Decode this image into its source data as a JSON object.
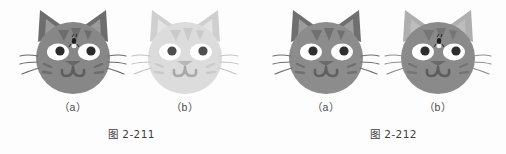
{
  "page": {
    "background_color": "#fdfdfd",
    "width": 506,
    "height": 154
  },
  "figures": [
    {
      "caption": "图 2-211",
      "items": [
        {
          "sublabel": "（a）",
          "icon": "cat-face-icon",
          "description": "dark gray tabby cat face with flea mark on forehead",
          "colors": {
            "face": "#878787",
            "ear_outer": "#6d6d6d",
            "ear_inner": "#9a9a9a",
            "stripe": "#6d6d6d",
            "eye_white": "#ffffff",
            "pupil": "#2b2b2b",
            "nose": "#676767",
            "mouth": "#5e5e5e",
            "whisker": "#6a6a6a"
          },
          "has_forehead_mark": true,
          "forehead_mark_color": "#1f1f1f"
        },
        {
          "sublabel": "（b）",
          "icon": "cat-face-icon",
          "description": "washed out light gray cat face",
          "colors": {
            "face": "#dcdcdc",
            "ear_outer": "#cfcfcf",
            "ear_inner": "#e4e4e4",
            "stripe": "#cacaca",
            "eye_white": "#ffffff",
            "pupil": "#4e4e4e",
            "nose": "#b7b7b7",
            "mouth": "#a8a8a8",
            "whisker": "#c4c4c4"
          },
          "has_forehead_mark": false,
          "forehead_mark_color": "#1f1f1f"
        }
      ]
    },
    {
      "caption": "图 2-212",
      "items": [
        {
          "sublabel": "（a）",
          "icon": "cat-face-icon",
          "description": "medium gray tabby cat face, no forehead mark",
          "colors": {
            "face": "#8c8c8c",
            "ear_outer": "#6f6f6f",
            "ear_inner": "#9d9d9d",
            "stripe": "#707070",
            "eye_white": "#ffffff",
            "pupil": "#2f2f2f",
            "nose": "#6b6b6b",
            "mouth": "#606060",
            "whisker": "#6e6e6e"
          },
          "has_forehead_mark": false,
          "forehead_mark_color": "#1f1f1f"
        },
        {
          "sublabel": "（b）",
          "icon": "cat-face-icon",
          "description": "gray cat face with lighter ears and flea mark on forehead",
          "colors": {
            "face": "#8a8a8a",
            "ear_outer": "#aeaeae",
            "ear_inner": "#bdbdbd",
            "stripe": "#757575",
            "eye_white": "#ffffff",
            "pupil": "#2d2d2d",
            "nose": "#6a6a6a",
            "mouth": "#5d5d5d",
            "whisker": "#8f8f8f"
          },
          "has_forehead_mark": true,
          "forehead_mark_color": "#1f1f1f"
        }
      ]
    }
  ]
}
